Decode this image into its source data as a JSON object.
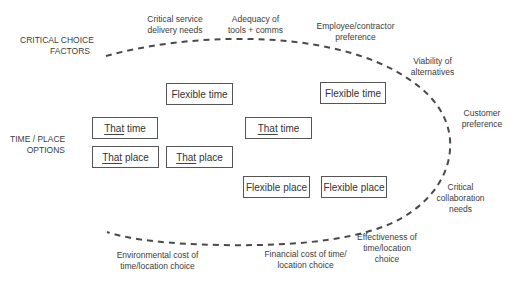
{
  "diagram": {
    "row_labels": {
      "critical_choice_factors": [
        "CRITICAL CHOICE",
        "FACTORS"
      ],
      "time_place_options": [
        "TIME / PLACE",
        "OPTIONS"
      ]
    },
    "factors": {
      "critical_service": [
        "Critical service",
        "delivery needs"
      ],
      "adequacy_tools": [
        "Adequacy of",
        "tools + comms"
      ],
      "employee_pref": [
        "Employee/contractor",
        "preference"
      ],
      "viability": [
        "Viability of",
        "alternatives"
      ],
      "customer_pref": [
        "Customer",
        "preference"
      ],
      "collaboration": [
        "Critical",
        "collaboration",
        "needs"
      ],
      "effectiveness": [
        "Effectiveness of",
        "time/location",
        "choice"
      ],
      "financial_cost": [
        "Financial cost of time/",
        "location choice"
      ],
      "environmental_cost": [
        "Environmental cost of",
        "time/location choice"
      ]
    },
    "boxes": {
      "that_time_left": {
        "underlined": "That",
        "rest": " time"
      },
      "that_place_left": {
        "underlined": "That",
        "rest": " place"
      },
      "flexible_time_left": {
        "text": "Flexible time"
      },
      "that_place_middle": {
        "underlined": "That",
        "rest": " place"
      },
      "that_time_middle": {
        "underlined": "That",
        "rest": " time"
      },
      "flexible_time_right": {
        "text": "Flexible time"
      },
      "flexible_place_left": {
        "text": "Flexible place"
      },
      "flexible_place_right": {
        "text": "Flexible place"
      }
    },
    "colors": {
      "dash": "#4a4a4a",
      "border": "#555555",
      "text": "#3c3c3c"
    }
  }
}
